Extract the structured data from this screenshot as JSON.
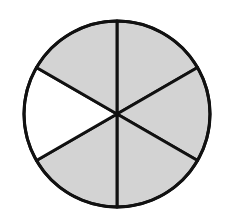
{
  "diagram": {
    "type": "fraction-circle",
    "total_sectors": 6,
    "shaded_sectors": 5,
    "unshaded_sectors": 1,
    "fraction_shaded": "5/6",
    "center": [
      117,
      114
    ],
    "radius": 93,
    "colors": {
      "shaded": "#d3d3d3",
      "unshaded": "#ffffff",
      "stroke": "#111111"
    },
    "sectors": [
      {
        "index": 0,
        "position": "upper-right",
        "start_deg": -90,
        "end_deg": -30,
        "shaded": true
      },
      {
        "index": 1,
        "position": "right",
        "start_deg": -30,
        "end_deg": 30,
        "shaded": true
      },
      {
        "index": 2,
        "position": "lower-right",
        "start_deg": 30,
        "end_deg": 90,
        "shaded": true
      },
      {
        "index": 3,
        "position": "lower-left",
        "start_deg": 90,
        "end_deg": 150,
        "shaded": true
      },
      {
        "index": 4,
        "position": "left",
        "start_deg": 150,
        "end_deg": 210,
        "shaded": false
      },
      {
        "index": 5,
        "position": "upper-left",
        "start_deg": 210,
        "end_deg": 270,
        "shaded": true
      }
    ]
  }
}
